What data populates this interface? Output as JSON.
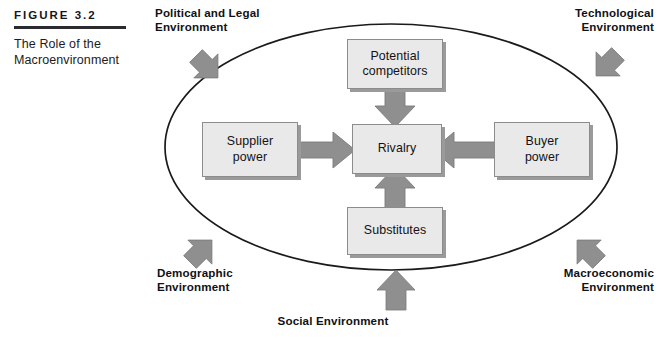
{
  "figure": {
    "label": "FIGURE 3.2",
    "title": "The Role of the Macroenvironment"
  },
  "colors": {
    "arrow_fill": "#8f8f8f",
    "arrow_stroke": "#6f6f6f",
    "box_fill": "#e9e9e9",
    "box_border": "#8c8c8c",
    "ellipse_stroke": "#1a1a1a",
    "text": "#121216"
  },
  "ellipse": {
    "name": "macroenvironment-boundary",
    "cx": 391,
    "cy": 147,
    "rx": 226,
    "ry": 123
  },
  "environments": [
    {
      "id": "political",
      "label_line1": "Political and Legal",
      "label_line2": "Environment",
      "arrow_direction": "down-right",
      "position": "top-left"
    },
    {
      "id": "technological",
      "label_line1": "Technological",
      "label_line2": "Environment",
      "arrow_direction": "down-left",
      "position": "top-right"
    },
    {
      "id": "demographic",
      "label_line1": "Demographic",
      "label_line2": "Environment",
      "arrow_direction": "up-right",
      "position": "bottom-left"
    },
    {
      "id": "macroeconomic",
      "label_line1": "Macroeconomic",
      "label_line2": "Environment",
      "arrow_direction": "up-left",
      "position": "bottom-right"
    },
    {
      "id": "social",
      "label_line1": "Social Environment",
      "label_line2": "",
      "arrow_direction": "up",
      "position": "bottom-center"
    }
  ],
  "forces": {
    "potential_competitors": {
      "line1": "Potential",
      "line2": "competitors"
    },
    "supplier_power": {
      "line1": "Supplier",
      "line2": "power"
    },
    "rivalry": {
      "line1": "Rivalry",
      "line2": ""
    },
    "buyer_power": {
      "line1": "Buyer",
      "line2": "power"
    },
    "substitutes": {
      "line1": "Substitutes",
      "line2": ""
    }
  },
  "inner_arrows": [
    {
      "id": "competitors-to-rivalry",
      "from": "potential_competitors",
      "to": "rivalry",
      "direction": "down"
    },
    {
      "id": "substitutes-to-rivalry",
      "from": "substitutes",
      "to": "rivalry",
      "direction": "up"
    },
    {
      "id": "supplier-to-rivalry",
      "from": "supplier_power",
      "to": "rivalry",
      "direction": "right"
    },
    {
      "id": "buyer-to-rivalry",
      "from": "buyer_power",
      "to": "rivalry",
      "direction": "left"
    }
  ]
}
